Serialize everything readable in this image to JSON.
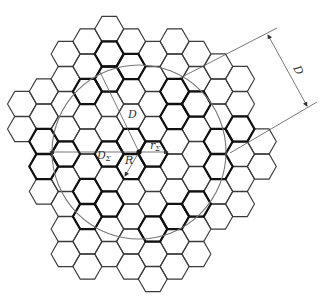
{
  "diagram": {
    "type": "hexagonal-cell-grid",
    "hex": {
      "side": 14.5,
      "col_spacing": 21.8,
      "row_spacing": 25,
      "origin_x": 22,
      "even_col_first_y": 29,
      "odd_col_first_y": 41.5
    },
    "columns": [
      {
        "col": 0,
        "first_y": 104,
        "last_y": 129
      },
      {
        "col": 1,
        "first_y": 91.5,
        "last_y": 191.5
      },
      {
        "col": 2,
        "first_y": 54,
        "last_y": 254
      },
      {
        "col": 3,
        "first_y": 41.5,
        "last_y": 266.5
      },
      {
        "col": 4,
        "first_y": 29,
        "last_y": 254
      },
      {
        "col": 5,
        "first_y": 41.5,
        "last_y": 266.5
      },
      {
        "col": 6,
        "first_y": 54,
        "last_y": 279
      },
      {
        "col": 7,
        "first_y": 41.5,
        "last_y": 266.5
      },
      {
        "col": 8,
        "first_y": 54,
        "last_y": 254
      },
      {
        "col": 9,
        "first_y": 66.5,
        "last_y": 216.5
      },
      {
        "col": 10,
        "first_y": 79,
        "last_y": 204
      },
      {
        "col": 11,
        "first_y": 141.5,
        "last_y": 166.5
      }
    ],
    "bold_hexes": [
      [
        4,
        54
      ],
      [
        4,
        79
      ],
      [
        3,
        91.5
      ],
      [
        5,
        66.5
      ],
      [
        5,
        141.5
      ],
      [
        5,
        166.5
      ],
      [
        6,
        154
      ],
      [
        4,
        154
      ],
      [
        1,
        141.5
      ],
      [
        1,
        166.5
      ],
      [
        2,
        154
      ],
      [
        7,
        91.5
      ],
      [
        8,
        104
      ],
      [
        7,
        116.5
      ],
      [
        3,
        216.5
      ],
      [
        4,
        204
      ],
      [
        3,
        191.5
      ],
      [
        8,
        204
      ],
      [
        7,
        216.5
      ],
      [
        6,
        229
      ],
      [
        10,
        129
      ],
      [
        9,
        141.5
      ],
      [
        9,
        166.5
      ]
    ],
    "center_point": {
      "x": 139,
      "y": 152
    },
    "circle": {
      "cx": 139,
      "cy": 152,
      "r": 87
    },
    "radius_line_D": {
      "x1": 139,
      "y1": 152,
      "x2": 100,
      "y2": 72
    },
    "dimension_lines": {
      "upper": {
        "x1": 180,
        "y1": 78,
        "x2": 277,
        "y2": 28
      },
      "lower": {
        "x1": 230,
        "y1": 153,
        "x2": 317,
        "y2": 102
      },
      "arrow": {
        "x1": 268,
        "y1": 35,
        "x2": 307,
        "y2": 106
      }
    },
    "arrows": {
      "d_sigma": {
        "x1": 139,
        "y1": 152,
        "x2": 50,
        "y2": 152
      },
      "r": {
        "x1": 139,
        "y1": 152,
        "x2": 125,
        "y2": 176
      },
      "r_sigma": {
        "x1": 139,
        "y1": 152,
        "x2": 168,
        "y2": 152
      }
    },
    "labels": {
      "D_inner": {
        "text": "D",
        "x": 128,
        "y": 118
      },
      "D_dimension": {
        "text": "D",
        "x": 293,
        "y": 68,
        "rotate": 62
      },
      "D_sigma": {
        "text": "D",
        "sub": "Σ",
        "x": 97,
        "y": 159
      },
      "R": {
        "text": "R",
        "x": 125,
        "y": 164
      },
      "r_sigma": {
        "text": "r",
        "sub": "Σ",
        "x": 150,
        "y": 149
      }
    }
  }
}
